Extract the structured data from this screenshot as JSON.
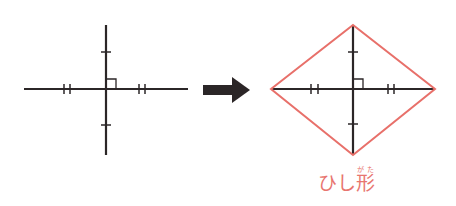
{
  "colors": {
    "line": "#2b2627",
    "rhombus": "#e8706a",
    "label": "#e8756f",
    "background": "#ffffff"
  },
  "left_figure": {
    "description": "two perpendicular segments bisecting each other",
    "horizontal": {
      "x1": 24,
      "x2": 188,
      "y": 89
    },
    "vertical": {
      "x": 106,
      "y1": 25,
      "y2": 155
    },
    "single_ticks_y": [
      52,
      125
    ],
    "double_ticks_x": [
      [
        64,
        70
      ],
      [
        139,
        145
      ]
    ],
    "right_angle": {
      "x": 106,
      "y": 89,
      "size": 10
    }
  },
  "arrow": {
    "x1": 203,
    "x2": 250,
    "y": 90,
    "icon": "right-arrow-icon"
  },
  "right_figure": {
    "description": "rhombus formed by connecting endpoints of perpendicular bisecting diagonals",
    "vertices": {
      "left": [
        271,
        89
      ],
      "top": [
        353,
        25
      ],
      "right": [
        435,
        89
      ],
      "bottom": [
        353,
        155
      ]
    },
    "single_ticks_y": [
      52,
      124
    ],
    "double_ticks_x": [
      [
        311,
        318
      ],
      [
        388,
        394
      ]
    ],
    "right_angle": {
      "x": 353,
      "y": 89,
      "size": 10
    }
  },
  "label": {
    "prefix": "ひし",
    "kanji": "形",
    "ruby": "がた"
  }
}
